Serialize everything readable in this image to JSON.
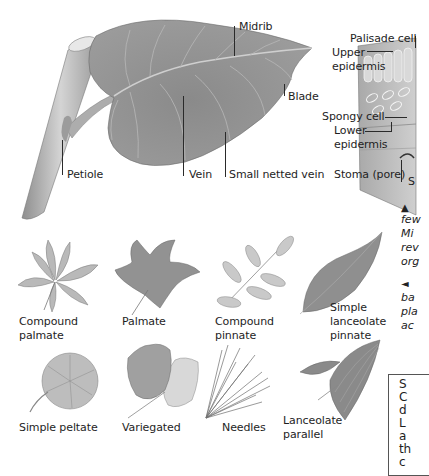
{
  "main_leaf": {
    "labels": {
      "midrib": "Midrib",
      "blade": "Blade",
      "petiole": "Petiole",
      "vein": "Vein",
      "small_netted_vein": "Small netted vein"
    }
  },
  "cross_section": {
    "labels": {
      "palisade_cell": "Palisade cell",
      "upper_epidermis_1": "Upper",
      "upper_epidermis_2": "epidermis",
      "spongy_cell": "Spongy cell",
      "lower_epidermis_1": "Lower",
      "lower_epidermis_2": "epidermis",
      "stoma": "Stoma (pore)",
      "cut_off_letter": "S"
    }
  },
  "captions": {
    "caption1": {
      "marker": "▲",
      "lines": [
        "few",
        "Mi",
        "rev",
        "org"
      ]
    },
    "caption2": {
      "marker": "◄",
      "lines": [
        "ba",
        "pla",
        "ac"
      ]
    }
  },
  "sidebar_box": {
    "lines": [
      "S",
      "C",
      "d",
      "L",
      "a",
      "th",
      "c"
    ]
  },
  "leaf_types": [
    {
      "id": "compound-palmate",
      "label_1": "Compound",
      "label_2": "palmate"
    },
    {
      "id": "palmate",
      "label_1": "Palmate",
      "label_2": ""
    },
    {
      "id": "compound-pinnate",
      "label_1": "Compound",
      "label_2": "pinnate"
    },
    {
      "id": "simple-lanceolate-pinnate",
      "label_1": "Simple",
      "label_2": "lanceolate",
      "label_3": "pinnate"
    },
    {
      "id": "simple-peltate",
      "label_1": "Simple peltate",
      "label_2": ""
    },
    {
      "id": "variegated",
      "label_1": "Variegated",
      "label_2": ""
    },
    {
      "id": "needles",
      "label_1": "Needles",
      "label_2": ""
    },
    {
      "id": "lanceolate-parallel",
      "label_1": "Lanceolate",
      "label_2": "parallel"
    }
  ],
  "colors": {
    "leaf_dark": "#7d7d7d",
    "leaf_mid": "#9a9a9a",
    "leaf_light": "#c4c4c4",
    "stem": "#b5b5b5",
    "text": "#1e1e1e"
  }
}
